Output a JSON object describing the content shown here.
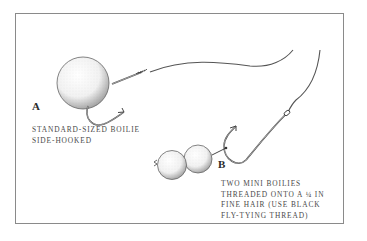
{
  "diagram": {
    "type": "fishing-rig-illustration",
    "panels": [
      {
        "id": "A",
        "label": "A",
        "caption_lines": [
          "STANDARD-SIZED BOILIE",
          "SIDE-HOOKED"
        ],
        "caption": "STANDARD-SIZED BOILIE\nSIDE-HOOKED",
        "elements": [
          "large-boilie",
          "hook",
          "line"
        ]
      },
      {
        "id": "B",
        "label": "B",
        "caption_lines": [
          "TWO MINI BOILIES",
          "THREADED ONTO A ¼ IN",
          "FINE HAIR (USE BLACK",
          "FLY-TYING THREAD)"
        ],
        "caption": "TWO MINI BOILIES\nTHREADED ONTO A ¼ IN\nFINE HAIR (USE BLACK\nFLY-TYING THREAD)",
        "elements": [
          "mini-boilie",
          "mini-boilie",
          "hair",
          "hook",
          "line"
        ]
      }
    ],
    "colors": {
      "ink": "#3a3a3a",
      "frame": "#8a8a8a",
      "background": "#ffffff"
    }
  }
}
